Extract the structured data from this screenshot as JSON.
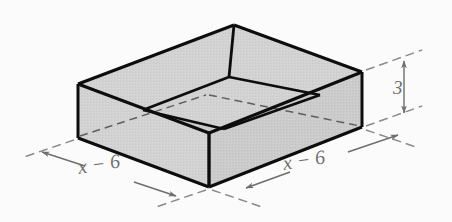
{
  "figure": {
    "shape_type": "open-top rectangular prism",
    "projection": "oblique isometric",
    "colors": {
      "background": "#fbfbfb",
      "face_fill": "#d2d2d2",
      "face_fill_inner": "#cfcfcf",
      "outline": "#0d0d0d",
      "hidden_edge": "#5a5a5a",
      "dimension_line": "#7a7a7a",
      "label_text": "#6f6f6f"
    },
    "labels": {
      "left_width": "x − 6",
      "right_width": "x − 6",
      "height": "3"
    },
    "dimensions": [
      {
        "name": "left-width",
        "value": "x − 6",
        "orientation": "oblique-left",
        "arrow_style": "double-headed"
      },
      {
        "name": "right-width",
        "value": "x − 6",
        "orientation": "oblique-right",
        "arrow_style": "double-headed"
      },
      {
        "name": "height",
        "value": "3",
        "orientation": "vertical",
        "arrow_style": "double-headed"
      }
    ],
    "geometry": {
      "outer_top_left": [
        78,
        84
      ],
      "outer_top_back": [
        234,
        25
      ],
      "outer_top_right": [
        362,
        72
      ],
      "outer_top_front": [
        209,
        133
      ],
      "outer_bottom_left": [
        78,
        138
      ],
      "outer_bottom_right": [
        362,
        127
      ],
      "outer_bottom_front": [
        209,
        187
      ],
      "inner_left": [
        143,
        110
      ],
      "inner_back": [
        229,
        77
      ],
      "inner_right": [
        320,
        95
      ],
      "inner_front": [
        224,
        129
      ]
    }
  }
}
